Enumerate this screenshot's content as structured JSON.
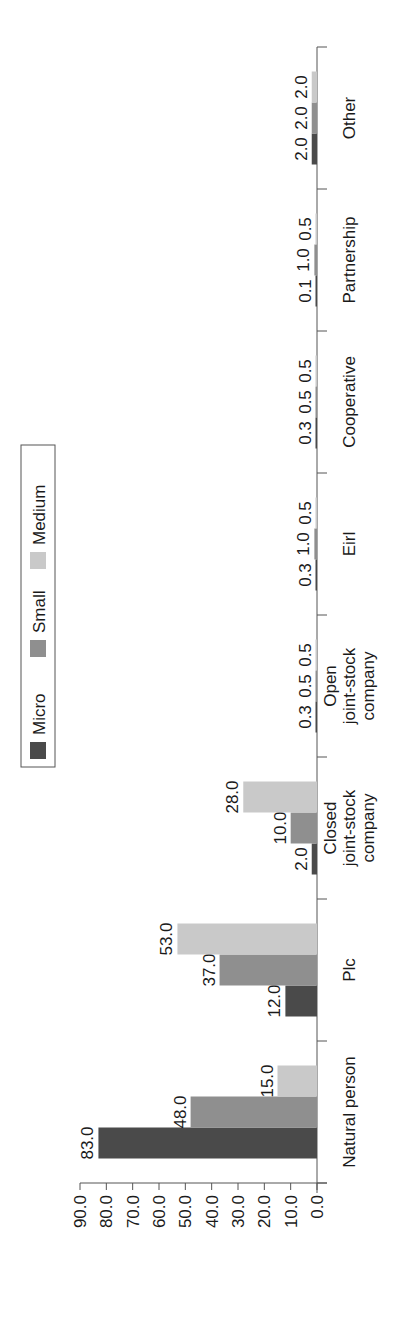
{
  "chart_data": {
    "type": "bar",
    "orientation": "vertical bars, figure rotated 90° counter-clockwise",
    "title": "",
    "xlabel": "",
    "ylabel": "",
    "ylim": [
      0,
      90
    ],
    "yticks": [
      "0.0",
      "10.0",
      "20.0",
      "30.0",
      "40.0",
      "50.0",
      "60.0",
      "70.0",
      "80.0",
      "90.0"
    ],
    "grid": false,
    "legend_position": "top (right side after rotation)",
    "categories": [
      "Natural person",
      "Plc",
      "Closed joint-stock company",
      "Open joint-stock company",
      "Eirl",
      "Cooperative",
      "Partnership",
      "Other"
    ],
    "category_label_lines": [
      [
        "Natural person"
      ],
      [
        "Plc"
      ],
      [
        "Closed",
        "joint-stock",
        "company"
      ],
      [
        "Open",
        "joint-stock",
        "company"
      ],
      [
        "Eirl"
      ],
      [
        "Cooperative"
      ],
      [
        "Partnership"
      ],
      [
        "Other"
      ]
    ],
    "series": [
      {
        "name": "Micro",
        "color": "#4a4a4a",
        "values": [
          83.0,
          12.0,
          2.0,
          0.3,
          0.3,
          0.3,
          0.1,
          2.0
        ]
      },
      {
        "name": "Small",
        "color": "#8f8f8f",
        "values": [
          48.0,
          37.0,
          10.0,
          0.5,
          1.0,
          0.5,
          1.0,
          2.0
        ]
      },
      {
        "name": "Medium",
        "color": "#c9c9c9",
        "values": [
          15.0,
          53.0,
          28.0,
          0.5,
          0.5,
          0.5,
          0.5,
          2.0
        ]
      }
    ],
    "data_labels": true
  },
  "legend": {
    "items": [
      {
        "label": "Micro",
        "color": "#4a4a4a"
      },
      {
        "label": "Small",
        "color": "#8f8f8f"
      },
      {
        "label": "Medium",
        "color": "#c9c9c9"
      }
    ]
  }
}
